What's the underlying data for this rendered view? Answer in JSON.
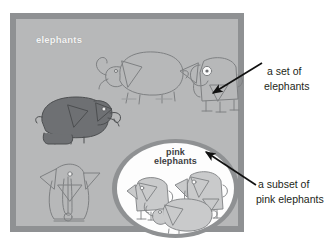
{
  "diagram": {
    "title_visible": false,
    "universal_set": {
      "label": "elephants",
      "label_color": "#f4f4f4",
      "fill_color": "#b7b8b9",
      "frame_color": "#8f9193"
    },
    "subset": {
      "label_line1": "pink",
      "label_line2": "elephants",
      "label_color": "#3e4042",
      "fill_color": "#fdfdfd",
      "ring_color": "#8f9193"
    },
    "annotations": [
      {
        "name": "a-set-of-elephants",
        "line1": "a set of",
        "line2": "elephants",
        "arrow_points_to": "elephant in universal set"
      },
      {
        "name": "a-subset-of-pink-elephants",
        "line1": "a subset of",
        "line2": "pink elephants",
        "arrow_points_to": "white ellipse subset"
      }
    ],
    "elephants_outside_subset": [
      {
        "name": "dark-elephant",
        "fill": "#6e7073",
        "style": "solid filled, facing right"
      },
      {
        "name": "line-elephant-top-middle",
        "fill": "none",
        "style": "outline, facing left"
      },
      {
        "name": "line-elephant-top-right",
        "fill": "none",
        "style": "outline, front view with eye"
      },
      {
        "name": "line-elephant-bottom-left",
        "fill": "none",
        "style": "outline, front view trunk down"
      }
    ],
    "elephants_inside_subset": [
      {
        "name": "pink-elephant-left",
        "fill": "#c9cacb",
        "style": "front view"
      },
      {
        "name": "pink-elephant-right",
        "fill": "#c9cacb",
        "style": "front view with ears"
      },
      {
        "name": "pink-elephant-bottom",
        "fill": "#c9cacb",
        "style": "side view facing left"
      }
    ],
    "arrow_color": "#111111"
  }
}
